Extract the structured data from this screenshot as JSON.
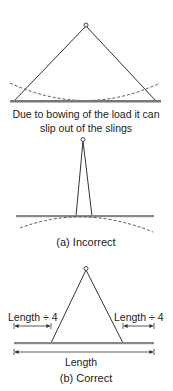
{
  "colors": {
    "line": "#333333",
    "load_bar": "#888888",
    "text": "#222222",
    "background": "#ffffff"
  },
  "diagram_top": {
    "caption_line1": "Due to bowing of the load it can",
    "caption_line2": "slip out of the slings"
  },
  "diagram_incorrect": {
    "caption": "(a) Incorrect"
  },
  "diagram_correct": {
    "left_dimension_label": "Length ÷ 4",
    "right_dimension_label": "Length ÷ 4",
    "overall_dimension_label": "Length",
    "caption": "(b) Correct"
  }
}
